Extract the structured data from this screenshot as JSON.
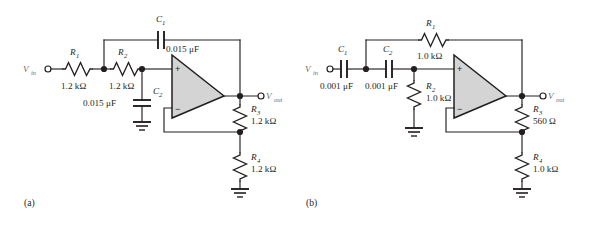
{
  "figure": {
    "background_color": "#ffffff",
    "ink_color": "#231f20",
    "opamp_fill_color": "#d4d4d4",
    "terminal_label_color": "#6e6e6e"
  },
  "panels": [
    {
      "id": "a",
      "caption": "(a)",
      "input_terminal": {
        "label": "V",
        "subscript": "in"
      },
      "output_terminal": {
        "label": "V",
        "subscript": "out"
      },
      "opamp": {
        "plus": "+",
        "minus": "−"
      },
      "components": [
        {
          "name": "R1",
          "designator": "R",
          "subscript": "1",
          "value": "1.2 kΩ",
          "type": "resistor",
          "orientation": "horizontal"
        },
        {
          "name": "R2",
          "designator": "R",
          "subscript": "2",
          "value": "1.2 kΩ",
          "type": "resistor",
          "orientation": "horizontal"
        },
        {
          "name": "C1",
          "designator": "C",
          "subscript": "1",
          "value": "0.015 μF",
          "type": "capacitor",
          "orientation": "horizontal"
        },
        {
          "name": "C2",
          "designator": "C",
          "subscript": "2",
          "value": "0.015 μF",
          "type": "capacitor",
          "orientation": "vertical"
        },
        {
          "name": "R3",
          "designator": "R",
          "subscript": "3",
          "value": "1.2 kΩ",
          "type": "resistor",
          "orientation": "vertical"
        },
        {
          "name": "R4",
          "designator": "R",
          "subscript": "4",
          "value": "1.2 kΩ",
          "type": "resistor",
          "orientation": "vertical"
        }
      ]
    },
    {
      "id": "b",
      "caption": "(b)",
      "input_terminal": {
        "label": "V",
        "subscript": "in"
      },
      "output_terminal": {
        "label": "V",
        "subscript": "out"
      },
      "opamp": {
        "plus": "+",
        "minus": "−"
      },
      "components": [
        {
          "name": "C1",
          "designator": "C",
          "subscript": "1",
          "value": "0.001 μF",
          "type": "capacitor",
          "orientation": "horizontal"
        },
        {
          "name": "C2",
          "designator": "C",
          "subscript": "2",
          "value": "0.001 μF",
          "type": "capacitor",
          "orientation": "horizontal"
        },
        {
          "name": "R1",
          "designator": "R",
          "subscript": "1",
          "value": "1.0 kΩ",
          "type": "resistor",
          "orientation": "horizontal"
        },
        {
          "name": "R2",
          "designator": "R",
          "subscript": "2",
          "value": "1.0 kΩ",
          "type": "resistor",
          "orientation": "vertical"
        },
        {
          "name": "R3",
          "designator": "R",
          "subscript": "3",
          "value": "560 Ω",
          "type": "resistor",
          "orientation": "vertical"
        },
        {
          "name": "R4",
          "designator": "R",
          "subscript": "4",
          "value": "1.0 kΩ",
          "type": "resistor",
          "orientation": "vertical"
        }
      ]
    }
  ]
}
